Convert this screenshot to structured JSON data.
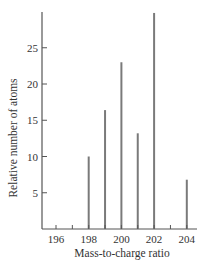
{
  "chart_data": {
    "type": "bar",
    "title": "",
    "xlabel": "Mass-to-charge ratio",
    "ylabel": "Relative number of atoms",
    "categories": [
      "196",
      "197",
      "198",
      "199",
      "200",
      "201",
      "202",
      "203",
      "204"
    ],
    "values": [
      0.15,
      0,
      10.0,
      16.4,
      23.0,
      13.2,
      29.8,
      0,
      6.8
    ],
    "x_ticks": [
      196,
      197,
      198,
      199,
      200,
      201,
      202,
      203,
      204
    ],
    "x_tick_labels": [
      "196",
      "198",
      "200",
      "202",
      "204"
    ],
    "y_ticks": [
      5,
      10,
      15,
      20,
      25
    ],
    "y_tick_labels": [
      "5",
      "10",
      "15",
      "20",
      "25"
    ],
    "xlim": [
      195.2,
      204.6
    ],
    "ylim": [
      0,
      31
    ],
    "grid": false,
    "legend": null
  },
  "colors": {
    "bar": "#7a7a7a",
    "axis": "#555555",
    "text": "#333333"
  }
}
